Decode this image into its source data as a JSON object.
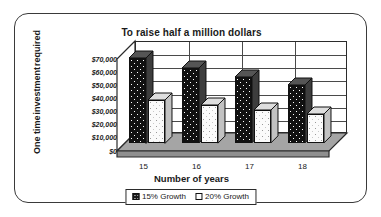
{
  "chart_data": {
    "type": "bar",
    "title": "To raise half a million dollars",
    "xlabel": "Number of years",
    "ylabel": "One time investment required",
    "ylabel_lines": [
      "One time",
      "investment",
      "required"
    ],
    "categories": [
      "15",
      "16",
      "17",
      "18"
    ],
    "series": [
      {
        "name": "15% Growth",
        "values": [
          65000,
          57000,
          50000,
          44000
        ],
        "swatch": "dark"
      },
      {
        "name": "20% Growth",
        "values": [
          33000,
          29000,
          25000,
          22000
        ],
        "swatch": "light"
      }
    ],
    "ylim": [
      0,
      70000
    ],
    "ytick_values": [
      0,
      10000,
      20000,
      30000,
      40000,
      50000,
      60000,
      70000
    ],
    "ytick_labels": [
      "$0",
      "$10,000",
      "$20,000",
      "$30,000",
      "$40,000",
      "$50,000",
      "$60,000",
      "$70,000"
    ],
    "grid": true,
    "legend_position": "bottom",
    "three_d": true,
    "colors": {
      "series_dark": "#111111",
      "series_light": "#fbfbfb",
      "axis": "#2b2b2b",
      "grid": "#4a4a4a",
      "floor": "#9d9d9d",
      "frame": "#3a3a3a",
      "background": "#ffffff"
    }
  }
}
